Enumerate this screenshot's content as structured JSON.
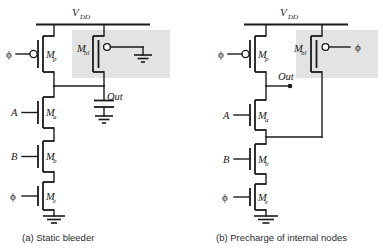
{
  "figure": {
    "type": "circuit-schematic",
    "colors": {
      "ink": "#1a1a1a",
      "highlight": "#e3e3e3",
      "background": "#ffffff"
    }
  },
  "panels": [
    {
      "id": "a",
      "caption": "(a) Static bleeder",
      "supply_label": "V",
      "supply_sub": "DD",
      "output_label": "Out",
      "clock_label": "ϕ",
      "transistors": [
        {
          "name": "Mp",
          "base": "M",
          "sub": "p",
          "type": "pmos",
          "gate_input": "ϕ"
        },
        {
          "name": "Mbl",
          "base": "M",
          "sub": "bl",
          "type": "pmos",
          "gate_input": ""
        },
        {
          "name": "Ma",
          "base": "M",
          "sub": "a",
          "type": "nmos",
          "gate_input": "A"
        },
        {
          "name": "Mb",
          "base": "M",
          "sub": "b",
          "type": "nmos",
          "gate_input": "B"
        },
        {
          "name": "Me",
          "base": "M",
          "sub": "e",
          "type": "nmos",
          "gate_input": "ϕ"
        }
      ],
      "inputs": [
        "ϕ",
        "A",
        "B",
        "ϕ"
      ],
      "has_load_capacitor": true,
      "highlight_region": "bleeder-transistor"
    },
    {
      "id": "b",
      "caption": "(b) Precharge of internal nodes",
      "supply_label": "V",
      "supply_sub": "DD",
      "output_label": "Out",
      "clock_label": "ϕ",
      "transistors": [
        {
          "name": "Mp",
          "base": "M",
          "sub": "p",
          "type": "pmos",
          "gate_input": "ϕ"
        },
        {
          "name": "Mbl",
          "base": "M",
          "sub": "bl",
          "type": "pmos",
          "gate_input": "ϕ"
        },
        {
          "name": "Ma",
          "base": "M",
          "sub": "a",
          "type": "nmos",
          "gate_input": "A"
        },
        {
          "name": "Mb",
          "base": "M",
          "sub": "b",
          "type": "nmos",
          "gate_input": "B"
        },
        {
          "name": "Me",
          "base": "M",
          "sub": "e",
          "type": "nmos",
          "gate_input": "ϕ"
        }
      ],
      "inputs": [
        "ϕ",
        "A",
        "B",
        "ϕ",
        "ϕ"
      ],
      "has_load_capacitor": false,
      "highlight_region": "precharge-transistor"
    }
  ]
}
